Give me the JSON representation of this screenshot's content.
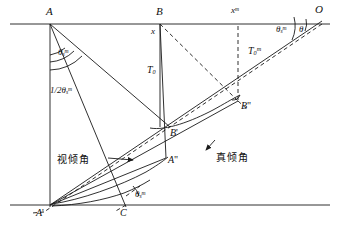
{
  "figure": {
    "type": "geometric-diagram",
    "stroke_color": "#1a1a1a",
    "background_color": "#ffffff"
  },
  "labels": {
    "point_A": "A",
    "point_B": "B",
    "point_O": "O",
    "point_A_prime": "A",
    "point_A_prime_mark": "'",
    "point_C": "C",
    "point_B_prime": "B",
    "point_B_prime_mark": "'",
    "point_A_dprime": "A",
    "point_A_dprime_mark": "\"",
    "point_B_dprime": "B",
    "point_B_dprime_mark": "\"",
    "offset_x": "x",
    "offset_x_m": "x",
    "offset_x_m_sup": "m",
    "time_T0": "T",
    "time_T0_sub": "0",
    "time_T0m": "T",
    "time_T0m_sub": "0",
    "time_T0m_sup": "m",
    "half_angle": "1/2",
    "half_angle_theta": "θ",
    "half_angle_sub": "s",
    "half_angle_sup": "m",
    "angle_theta_A": "θ",
    "angle_theta_A_sub": "s",
    "angle_theta_A_sup": "m",
    "angle_theta_C": "θ",
    "angle_theta_C_sub": "s",
    "angle_theta_C_sup": "m",
    "angle_theta_O": "θ",
    "angle_theta_O_sub": "s",
    "angle_theta_O_sup": "m",
    "angle_theta_plain": "θ",
    "apparent_dip": "视倾角",
    "true_dip": "真倾角"
  },
  "geometry": {
    "surface_line": {
      "x1": 10,
      "y1": 24,
      "x2": 330,
      "y2": 24
    },
    "datum_line": {
      "x1": 10,
      "y1": 205,
      "x2": 330,
      "y2": 205
    },
    "point_A": {
      "x": 50,
      "y": 24
    },
    "point_B": {
      "x": 160,
      "y": 24
    },
    "point_O": {
      "x": 322,
      "y": 21
    },
    "point_xm": {
      "x": 238,
      "y": 24
    },
    "point_A_prime": {
      "x": 50,
      "y": 205
    },
    "point_C": {
      "x": 126,
      "y": 205
    },
    "point_B_prime": {
      "x": 170,
      "y": 127
    },
    "point_A_dprime": {
      "x": 166,
      "y": 158
    },
    "point_B_dprime": {
      "x": 238,
      "y": 101
    }
  }
}
